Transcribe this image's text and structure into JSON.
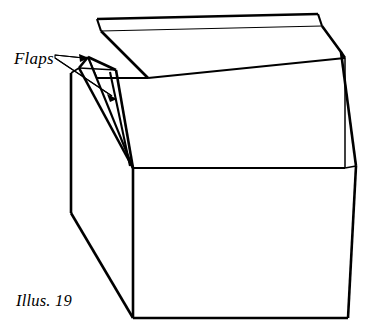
{
  "figure": {
    "kind": "line-drawing",
    "caption": "Illus. 19",
    "annotation_label": "Flaps",
    "stroke_color": "#000000",
    "fill_color": "#ffffff",
    "background_color": "#ffffff",
    "canvas": {
      "width": 380,
      "height": 335
    }
  },
  "labels": {
    "flaps": "Flaps",
    "illus": "Illus. 19"
  },
  "geometry": {
    "front_face": {
      "name": "front-panel",
      "points": "133,168 345,168 348,318 133,318"
    },
    "front_upper_face": {
      "name": "front-upper-panel",
      "points": "133,168 345,168 345,58 148,78"
    },
    "left_face": {
      "name": "left-side-panel",
      "points": "71,73 133,168 133,318 71,213"
    },
    "top_flap_face": {
      "name": "top-flap-panel",
      "points": "97,19 318,14 345,58 148,78"
    },
    "top_flap_edge": {
      "name": "top-flap-thin-edge",
      "points": "97,19 318,14 322,25 101,31"
    },
    "right_bevel": {
      "name": "right-bevel-panel",
      "points": "318,14 345,58 345,168 348,318 352,290 356,165 341,52"
    },
    "near_flap": {
      "name": "near-flap-wedge",
      "points": "71,73 88,57 133,168"
    },
    "far_flap": {
      "name": "far-flap-wedge",
      "points": "88,57 116,70 133,168"
    }
  },
  "leaders": [
    {
      "name": "leader-to-near-flap",
      "path": "54,56 86,59"
    },
    {
      "name": "leader-to-far-flap",
      "path": "54,58 114,97"
    }
  ]
}
